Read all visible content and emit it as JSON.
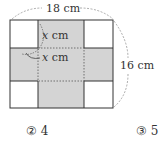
{
  "diagram": {
    "width_label": "18 cm",
    "height_label": "16 cm",
    "cut_label_1_var": "x",
    "cut_label_1_unit": " cm",
    "cut_label_2_var": "x",
    "cut_label_2_unit": " cm",
    "shade_color": "#d4d4d4",
    "line_color": "#333333"
  },
  "choices": [
    {
      "marker": "②",
      "value": "4"
    },
    {
      "marker": "③",
      "value": "5"
    }
  ]
}
